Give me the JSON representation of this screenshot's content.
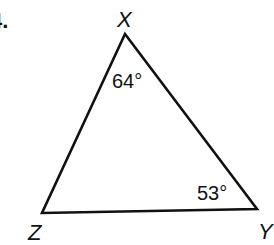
{
  "problem": {
    "number": "4."
  },
  "triangle": {
    "vertices": [
      {
        "name": "X",
        "x": 125,
        "y": 34
      },
      {
        "name": "Y",
        "x": 257,
        "y": 209
      },
      {
        "name": "Z",
        "x": 42,
        "y": 213
      }
    ],
    "angles": {
      "X": "64°",
      "Y": "53°"
    },
    "stroke_color": "#111111"
  }
}
